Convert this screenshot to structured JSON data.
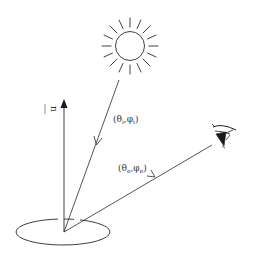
{
  "diagram": {
    "type": "reflectance-geometry",
    "colors": {
      "stroke": "#2a2a2a",
      "background": "#ffffff"
    },
    "labels": {
      "normal": "n",
      "incident": "(θ",
      "incident_sub_theta": "i",
      "incident_mid": ",φ",
      "incident_sub_phi": "i",
      "incident_close": ")",
      "emergent": "(θ",
      "emergent_sub_theta": "e",
      "emergent_mid": ",φ",
      "emergent_sub_phi": "e",
      "emergent_close": ")"
    },
    "elements": {
      "light_source": "sun-icon",
      "observer": "eye-icon",
      "surface": "surface-ellipse",
      "normal_vector": "normal-arrow",
      "incident_ray": "incident-ray",
      "emergent_ray": "emergent-ray"
    }
  }
}
